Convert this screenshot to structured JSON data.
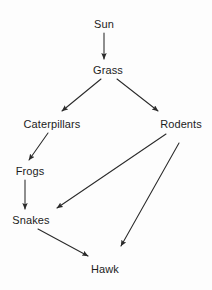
{
  "diagram": {
    "type": "directed-graph",
    "width": 212,
    "height": 290,
    "background_color": "#fdfdfd",
    "line_color": "#2a2a2a",
    "text_color": "#1c1c1c",
    "font_size_px": 11,
    "nodes": [
      {
        "id": "sun",
        "label": "Sun",
        "x": 104,
        "y": 24,
        "trophic_level": "energy source"
      },
      {
        "id": "grass",
        "label": "Grass",
        "x": 108,
        "y": 70,
        "trophic_level": "producer"
      },
      {
        "id": "caterpillars",
        "label": "Caterpillars",
        "x": 52,
        "y": 124,
        "trophic_level": "primary consumer"
      },
      {
        "id": "rodents",
        "label": "Rodents",
        "x": 181,
        "y": 124,
        "trophic_level": "primary consumer"
      },
      {
        "id": "frogs",
        "label": "Frogs",
        "x": 30,
        "y": 171,
        "trophic_level": "secondary consumer"
      },
      {
        "id": "snakes",
        "label": "Snakes",
        "x": 31,
        "y": 220,
        "trophic_level": "tertiary consumer"
      },
      {
        "id": "hawk",
        "label": "Hawk",
        "x": 105,
        "y": 269,
        "trophic_level": "apex predator"
      }
    ],
    "edges": [
      {
        "id": "sun-grass",
        "from": "sun",
        "to": "grass",
        "x1": 104,
        "y1": 33,
        "x2": 104,
        "y2": 59
      },
      {
        "id": "grass-caterpillars",
        "from": "grass",
        "to": "caterpillars",
        "x1": 101,
        "y1": 79,
        "x2": 62,
        "y2": 111
      },
      {
        "id": "grass-rodents",
        "from": "grass",
        "to": "rodents",
        "x1": 117,
        "y1": 79,
        "x2": 158,
        "y2": 111
      },
      {
        "id": "caterpillars-frogs",
        "from": "caterpillars",
        "to": "frogs",
        "x1": 48,
        "y1": 133,
        "x2": 29,
        "y2": 160
      },
      {
        "id": "frogs-snakes",
        "from": "frogs",
        "to": "snakes",
        "x1": 25,
        "y1": 180,
        "x2": 25,
        "y2": 209
      },
      {
        "id": "rodents-snakes",
        "from": "rodents",
        "to": "snakes",
        "x1": 166,
        "y1": 134,
        "x2": 57,
        "y2": 208
      },
      {
        "id": "rodents-hawk",
        "from": "rodents",
        "to": "hawk",
        "x1": 179,
        "y1": 143,
        "x2": 121,
        "y2": 246
      },
      {
        "id": "snakes-hawk",
        "from": "snakes",
        "to": "hawk",
        "x1": 38,
        "y1": 229,
        "x2": 88,
        "y2": 256
      }
    ]
  }
}
